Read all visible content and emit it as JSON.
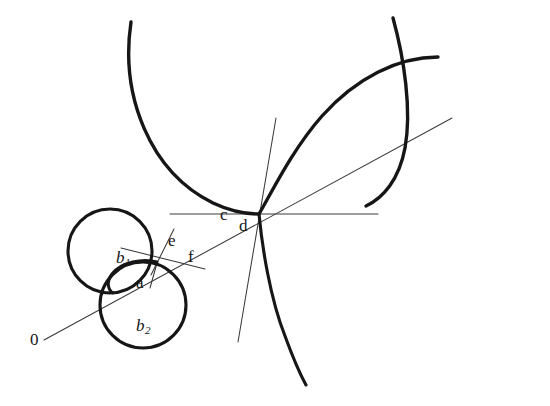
{
  "figure": {
    "type": "geometric-construction-diagram",
    "background_color": "#ffffff",
    "ink_color": "#161616",
    "thin_ink_color": "#3a3a3a",
    "width": 550,
    "height": 406,
    "labels": [
      {
        "id": "origin",
        "text": "0",
        "x": 30,
        "y": 338,
        "italic": false
      },
      {
        "id": "b1",
        "text": "b",
        "subscript": "1",
        "x": 116,
        "y": 257,
        "italic": true
      },
      {
        "id": "b2",
        "text": "b",
        "subscript": "2",
        "x": 136,
        "y": 325,
        "italic": true
      },
      {
        "id": "a",
        "text": "a",
        "x": 136,
        "y": 282,
        "italic": false
      },
      {
        "id": "e",
        "text": "e",
        "x": 168,
        "y": 240,
        "italic": false
      },
      {
        "id": "f",
        "text": "f",
        "x": 188,
        "y": 256,
        "italic": false
      },
      {
        "id": "c",
        "text": "c",
        "x": 220,
        "y": 213,
        "italic": false
      },
      {
        "id": "d",
        "text": "d",
        "x": 239,
        "y": 224,
        "italic": false
      }
    ],
    "points": {
      "origin": {
        "x": 44,
        "y": 340
      },
      "small_tangency": {
        "x": 157,
        "y": 263
      },
      "cusp": {
        "x": 260,
        "y": 214
      }
    },
    "circles": [
      {
        "id": "b1-circle",
        "cx": 110,
        "cy": 251,
        "r": 42,
        "stroke_width": 3.1
      },
      {
        "id": "b2-circle",
        "cx": 143,
        "cy": 305,
        "r": 43,
        "stroke_width": 3.1
      }
    ],
    "arcs": [
      {
        "id": "large-left-arc",
        "description": "big arc from upper-left sweeping down to the cusp",
        "stroke_width": 3.4
      },
      {
        "id": "large-right-arc",
        "description": "big arc from the cusp sweeping up to the upper-right",
        "stroke_width": 3.4
      },
      {
        "id": "upper-right-arc",
        "description": "arc crossing the right arc near the top right",
        "stroke_width": 3.4
      },
      {
        "id": "cusp-lower-branch",
        "description": "branch descending from the cusp to lower right",
        "stroke_width": 3.1
      },
      {
        "id": "small-inner-arc",
        "description": "short heavy arc inside the small circles near b1",
        "stroke_width": 3.0
      }
    ],
    "lines": [
      {
        "id": "radial-line-0",
        "description": "thin oblique line from 0 through the tangency to the upper right",
        "stroke_width": 1.0
      },
      {
        "id": "horizontal-line-c",
        "description": "thin horizontal line through the cusp",
        "stroke_width": 1.0
      },
      {
        "id": "steep-line-d",
        "description": "thin steep line through the cusp",
        "stroke_width": 1.0
      },
      {
        "id": "tangent-line-ef",
        "description": "thin tangent line at the small tangency point",
        "stroke_width": 1.0
      },
      {
        "id": "normal-line-e",
        "description": "thin short normal line at the small tangency point",
        "stroke_width": 1.0
      },
      {
        "id": "chord-line-a",
        "description": "thin short line from the tangency down to a",
        "stroke_width": 1.0
      }
    ]
  }
}
